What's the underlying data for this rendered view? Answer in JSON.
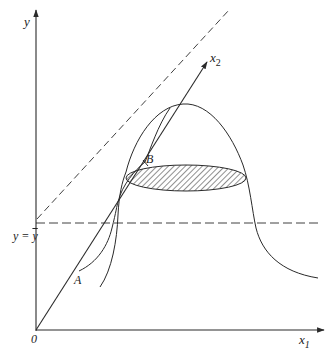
{
  "figure": {
    "type": "diagram",
    "axes": {
      "y_label": "y",
      "x1_label": "x",
      "x1_sub": "1",
      "x2_label": "x",
      "x2_sub": "2",
      "origin_label": "0"
    },
    "reference_line": {
      "label_left": "y = ",
      "label_right": "y"
    },
    "points": {
      "A": "A",
      "B": "B"
    },
    "colors": {
      "stroke": "#2a2a2a",
      "background": "#ffffff"
    }
  }
}
